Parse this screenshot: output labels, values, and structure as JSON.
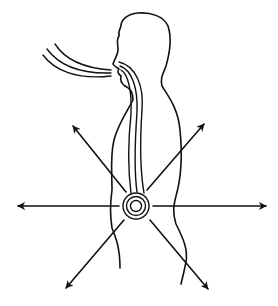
{
  "figure": {
    "title": "",
    "colors": {
      "background": "#ffffff",
      "ink": "#111111"
    },
    "elements": {
      "figure_outline": "human-profile-silhouette",
      "breath_inflow": {
        "stream_count": 3,
        "direction": "into-nose"
      },
      "breath_channel": {
        "stream_count": 3,
        "direction": "down-to-abdomen"
      },
      "energy_center": {
        "ring_count": 3
      },
      "radiating_arrows": {
        "count": 6,
        "directions": [
          "left",
          "right",
          "upper-left",
          "upper-right",
          "lower-left",
          "lower-right"
        ]
      }
    }
  }
}
